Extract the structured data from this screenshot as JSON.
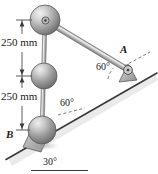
{
  "figure": {
    "background_color": "#ffffff",
    "line_color": "#3a3a3a",
    "sphere_color_light": "#e8e8e8",
    "sphere_color_dark": "#6f6f6f",
    "support_color": "#b8b8b8"
  },
  "labels": {
    "dimension_top": "250 mm",
    "dimension_bottom": "250 mm",
    "angle_at_b": "60°",
    "angle_at_a": "60°",
    "incline_angle": "30°",
    "point_a": "A",
    "point_b": "B"
  },
  "geometry": {
    "sphere_top": {
      "cx": 45,
      "cy": 20,
      "r": 15
    },
    "sphere_middle": {
      "cx": 44,
      "cy": 76,
      "r": 13
    },
    "sphere_bottom": {
      "cx": 42,
      "cy": 130,
      "r": 14
    },
    "pin_a": {
      "cx": 128,
      "cy": 70,
      "r": 4
    },
    "incline_start": {
      "x": 8,
      "y": 158
    },
    "incline_end": {
      "x": 155,
      "y": 74
    },
    "rod_a_start": {
      "x": 45,
      "y": 20
    },
    "rod_a_end": {
      "x": 128,
      "y": 70
    },
    "dimension_line_x": 22,
    "dimension_ticks_y": [
      20,
      76,
      130
    ]
  },
  "icons": {
    "pin_joint_top": "pin-joint-icon",
    "pin_joint_a": "pin-joint-icon",
    "arrow_up": "arrow-up-icon",
    "arrow_down": "arrow-down-icon"
  }
}
